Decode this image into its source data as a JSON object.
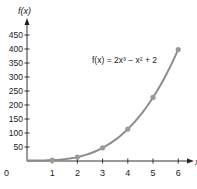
{
  "chart_data": {
    "type": "line",
    "title": "",
    "xlabel": "x",
    "ylabel": "f(x)",
    "annotation": "f(x) = 2x³ − x² + 2",
    "x": [
      0,
      1,
      2,
      3,
      4,
      5,
      6
    ],
    "series": [
      {
        "name": "f(x) = 2x³ − x² + 2",
        "values": [
          2,
          3,
          14,
          47,
          114,
          227,
          398
        ]
      }
    ],
    "markers_at": [
      1,
      2,
      3,
      4,
      5,
      6
    ],
    "xticks": [
      "0",
      "1",
      "2",
      "3",
      "4",
      "5",
      "6"
    ],
    "yticks": [
      "50",
      "100",
      "150",
      "200",
      "250",
      "300",
      "350",
      "400",
      "450"
    ],
    "xlim": [
      0,
      6.5
    ],
    "ylim": [
      0,
      480
    ],
    "grid": false,
    "colors": {
      "curve": "#8c8c8c",
      "axis": "#333333"
    }
  }
}
